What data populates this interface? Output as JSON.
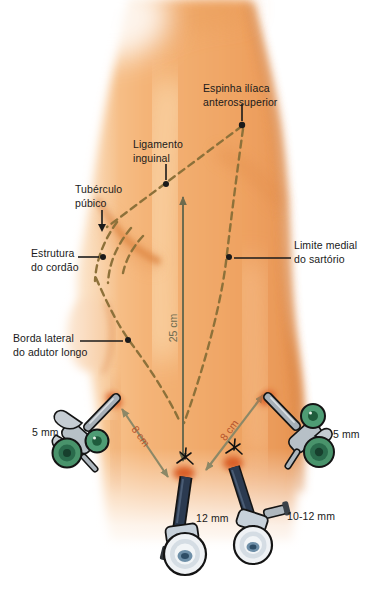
{
  "figure": {
    "labels": {
      "asis": {
        "text": "Espinha ilíaca\nanterossuperior"
      },
      "inguinal_ligament": {
        "text": "Ligamento\ninguinal"
      },
      "pubic_tubercle": {
        "text": "Tubérculo\npúbico"
      },
      "cord_structure": {
        "text": "Estrutura\ndo cordão"
      },
      "sartorius_medial_limit": {
        "text": "Limite medial\ndo sartório"
      },
      "adductor_longus_lateral_border": {
        "text": "Borda lateral\ndo adutor longo"
      }
    },
    "measurements": {
      "vertical": "25 cm",
      "left_diagonal": "8 cm",
      "right_diagonal": "8 cm"
    },
    "ports": {
      "left_trocar": "5 mm",
      "right_trocar": "5 mm",
      "center_trocar": "12 mm",
      "paracenter_trocar": "10-12 mm"
    },
    "colors": {
      "skin": "#F2AE74",
      "skin_shadow": "#DD8B49",
      "dashed_line": "#8D713A",
      "measure_line": "#75714F",
      "measure_text_accent": "#B5542C",
      "trocar_green": "#3E8A63",
      "trocar_navy": "#2B3A50",
      "insertion_site": "#D95F28"
    }
  }
}
